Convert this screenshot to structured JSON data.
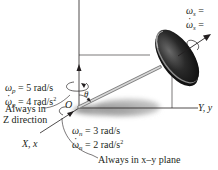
{
  "figure": {
    "type": "rigid-body-dynamics-diagram",
    "origin_label": "O",
    "angle_label": "θ",
    "axes": {
      "vertical": "",
      "horizontal": "Y, y",
      "diagonal": "X, x"
    },
    "spin": {
      "omega_symbol": "ω",
      "subscript": "s",
      "omega_value": "=",
      "omega_dot_value": "="
    },
    "precession": {
      "omega_symbol": "ω",
      "subscript": "p",
      "omega_value": "= 5 rad/s",
      "omega_dot_value": "= 4 rad/s",
      "omega_dot_power": "2",
      "note_line1": "Always in",
      "note_line2": "Z direction"
    },
    "nutation": {
      "omega_symbol": "ω",
      "subscript": "n",
      "omega_value": "= 3 rad/s",
      "omega_dot_value": "= 2 rad/s",
      "omega_dot_power": "2",
      "note": "Always in x–y plane"
    },
    "colors": {
      "ink": "#231f20",
      "disk_dark": "#1e1e1e",
      "disk_rim": "#8a8a8a",
      "shaft": "#b5b5b5",
      "shadow": "#9a9a9a"
    }
  }
}
